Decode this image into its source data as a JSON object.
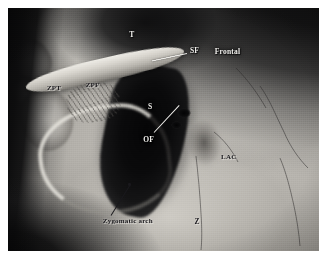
{
  "figure": {
    "kind": "anatomical-specimen-photograph",
    "media": "black-and-white photograph",
    "border_color": "#ffffff",
    "plate": {
      "left": 8,
      "top": 8,
      "width": 311,
      "height": 243
    }
  },
  "palette": {
    "background_dark": "#0a0a0b",
    "bone_light": "#e6e3dc",
    "bone_mid": "#b4b1ab",
    "bone_shadow": "#6e6b66",
    "cavity_black": "#050506",
    "label_light": "#f2f1ee",
    "label_dark": "#17161a",
    "plate_border": "#ffffff"
  },
  "labels": [
    {
      "id": "t",
      "text": "T",
      "tone": "light",
      "x": 39.0,
      "y": 9.5,
      "size": 7.5,
      "meaning": "temporal-bone"
    },
    {
      "id": "sf",
      "text": "SF",
      "tone": "light",
      "x": 58.5,
      "y": 16.0,
      "size": 7.5,
      "meaning": "supraorbital-foramen"
    },
    {
      "id": "frontal",
      "text": "Frontal",
      "tone": "light",
      "x": 66.5,
      "y": 16.5,
      "size": 7.5,
      "meaning": "frontal-bone"
    },
    {
      "id": "zpt",
      "text": "ZPT",
      "tone": "dark",
      "x": 12.5,
      "y": 31.5,
      "size": 7.0,
      "meaning": "zygomatic-process-of-temporal"
    },
    {
      "id": "zpf",
      "text": "ZPF",
      "tone": "dark",
      "x": 25.0,
      "y": 30.5,
      "size": 7.0,
      "meaning": "zygomatic-process-of-frontal"
    },
    {
      "id": "s",
      "text": "S",
      "tone": "light",
      "x": 45.0,
      "y": 39.0,
      "size": 7.5,
      "meaning": "sphenoid"
    },
    {
      "id": "of",
      "text": "OF",
      "tone": "light",
      "x": 43.5,
      "y": 52.5,
      "size": 7.5,
      "meaning": "optic-foramen"
    },
    {
      "id": "lac",
      "text": "LAC",
      "tone": "dark",
      "x": 68.5,
      "y": 60.0,
      "size": 7.0,
      "meaning": "lacrimal-bone"
    },
    {
      "id": "zygomatic-arch",
      "text": "Zygomatic arch",
      "tone": "dark",
      "x": 30.5,
      "y": 86.5,
      "size": 7.0,
      "meaning": "zygomatic-arch"
    },
    {
      "id": "z",
      "text": "Z",
      "tone": "dark",
      "x": 60.0,
      "y": 86.5,
      "size": 7.5,
      "meaning": "zygomatic-bone"
    }
  ],
  "leaders": [
    {
      "id": "sf-leader",
      "from_label": "SF",
      "tone": "light",
      "x": 57.5,
      "y": 18.5,
      "length": 11.5,
      "angle": 168
    },
    {
      "id": "of-leader",
      "from_label": "OF",
      "tone": "light",
      "x": 47.0,
      "y": 51.0,
      "length": 12.0,
      "angle": -47
    },
    {
      "id": "zygomatic-arch-leader",
      "from_label": "Zygomatic arch",
      "tone": "dark",
      "x": 33.0,
      "y": 85.0,
      "length": 11.5,
      "angle": -58,
      "dot": true
    }
  ],
  "cracks": [
    {
      "id": "crack-frontal-right",
      "d": "M 252 78 C 262 92 268 108 276 124 C 282 138 290 150 300 160"
    },
    {
      "id": "crack-frontal-diagonal",
      "d": "M 228 60 C 240 72 250 86 258 100"
    },
    {
      "id": "crack-lower-right",
      "d": "M 272 150 C 278 164 282 180 286 198 C 289 212 291 226 292 238"
    },
    {
      "id": "crack-orbit-floor",
      "d": "M 188 148 C 190 166 192 186 193 206 C 194 220 194 232 193 242"
    },
    {
      "id": "crack-lac-edge",
      "d": "M 206 124 C 216 132 224 142 230 154"
    }
  ]
}
